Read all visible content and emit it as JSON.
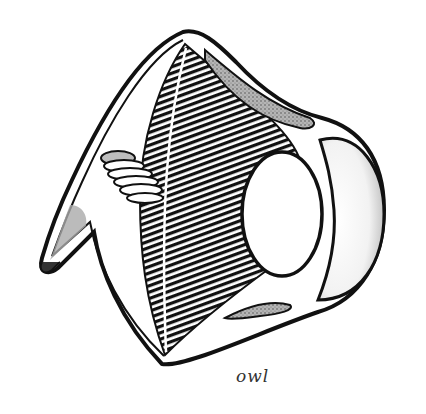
{
  "figure": {
    "caption": "owl",
    "colors": {
      "ink": "#111111",
      "background": "#ffffff",
      "shade": "#9a9a9a"
    },
    "parts": [
      "sclera-wall",
      "ciliary-muscle-fibers",
      "pecten",
      "lens",
      "cornea",
      "scleral-ossicles-upper",
      "scleral-ossicles-lower",
      "optic-nerve"
    ]
  }
}
